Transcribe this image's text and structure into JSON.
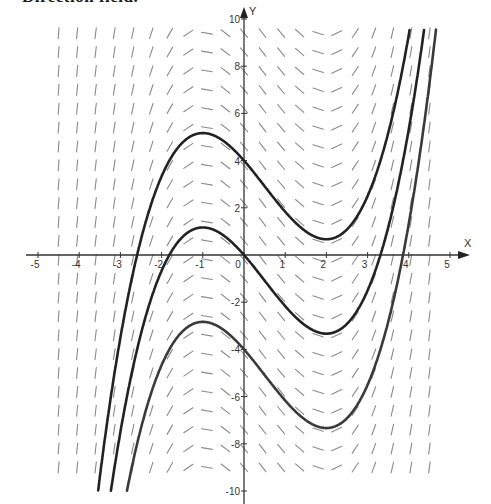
{
  "heading": {
    "text": "Direction field."
  },
  "chart_data": {
    "type": "line",
    "subtype": "slope-field-with-solution-curves",
    "title": "",
    "differential_equation": "y' = x^2 - x - 2",
    "xlabel": "X",
    "ylabel": "Y",
    "xlim": [
      -5,
      5
    ],
    "ylim": [
      -10,
      10
    ],
    "x_ticks": [
      -5,
      -4,
      -3,
      -2,
      -1,
      0,
      1,
      2,
      3,
      4,
      5
    ],
    "x_tick_labels": [
      "-5",
      "-4",
      "-3",
      "-2",
      "-1",
      "0",
      "1",
      "2",
      "3",
      "4",
      "5"
    ],
    "y_ticks": [
      -10,
      -8,
      -6,
      -4,
      -2,
      2,
      4,
      6,
      8,
      10
    ],
    "y_tick_labels": [
      "-10",
      "-8",
      "-6",
      "-4",
      "-2",
      "2",
      "4",
      "6",
      "8",
      "10"
    ],
    "grid": false,
    "legend": null,
    "slope_field": {
      "x_start": -4.5,
      "x_end": 4.5,
      "x_step": 0.45,
      "y_start": -9.0,
      "y_end": 9.6,
      "y_step": 0.8,
      "segment_length_px": 11,
      "color": "#8a8a8a"
    },
    "series": [
      {
        "name": "C = 4",
        "formula": "y = x^3/3 - x^2/2 - 2x + 4",
        "points": [
          [
            -3.5,
            -7.6
          ],
          [
            -3,
            -3.5
          ],
          [
            -2.5,
            -0.04
          ],
          [
            -2,
            3.33
          ],
          [
            -1.5,
            4.875
          ],
          [
            -1,
            5.17
          ],
          [
            -0.5,
            4.83
          ],
          [
            0,
            4.0
          ],
          [
            0.5,
            2.92
          ],
          [
            1,
            1.83
          ],
          [
            1.5,
            0.88
          ],
          [
            2,
            0.67
          ],
          [
            2.5,
            0.96
          ],
          [
            3,
            2.5
          ],
          [
            3.5,
            5.17
          ],
          [
            3.95,
            9.6
          ]
        ],
        "local_max": [
          -1,
          5.17
        ],
        "local_min": [
          2,
          0.67
        ],
        "color": "#222222"
      },
      {
        "name": "C = 0",
        "formula": "y = x^3/3 - x^2/2 - 2x",
        "points": [
          [
            -3.1,
            -10
          ],
          [
            -3,
            -7.5
          ],
          [
            -2.5,
            -4.04
          ],
          [
            -2,
            -0.67
          ],
          [
            -1.5,
            0.875
          ],
          [
            -1,
            1.17
          ],
          [
            -0.5,
            0.83
          ],
          [
            0,
            0
          ],
          [
            0.5,
            -1.08
          ],
          [
            1,
            -2.17
          ],
          [
            1.5,
            -3.13
          ],
          [
            2,
            -3.33
          ],
          [
            2.5,
            -3.04
          ],
          [
            3,
            -1.5
          ],
          [
            3.5,
            1.17
          ],
          [
            4,
            5.33
          ],
          [
            4.3,
            9.5
          ]
        ],
        "local_max": [
          -1,
          1.17
        ],
        "local_min": [
          2,
          -3.33
        ],
        "color": "#222222"
      },
      {
        "name": "C = -4",
        "formula": "y = x^3/3 - x^2/2 - 2x - 4",
        "points": [
          [
            -2.75,
            -10
          ],
          [
            -2.5,
            -8.04
          ],
          [
            -2,
            -4.67
          ],
          [
            -1.5,
            -3.125
          ],
          [
            -1,
            -2.83
          ],
          [
            -0.5,
            -3.17
          ],
          [
            0,
            -4
          ],
          [
            0.5,
            -5.08
          ],
          [
            1,
            -6.17
          ],
          [
            1.5,
            -7.13
          ],
          [
            2,
            -7.33
          ],
          [
            2.5,
            -7.04
          ],
          [
            3,
            -5.5
          ],
          [
            3.5,
            -2.83
          ],
          [
            4,
            1.33
          ],
          [
            4.55,
            9.5
          ]
        ],
        "local_max": [
          -1,
          -2.83
        ],
        "local_min": [
          2,
          -7.33
        ],
        "color": "#3a3a3a"
      }
    ]
  }
}
